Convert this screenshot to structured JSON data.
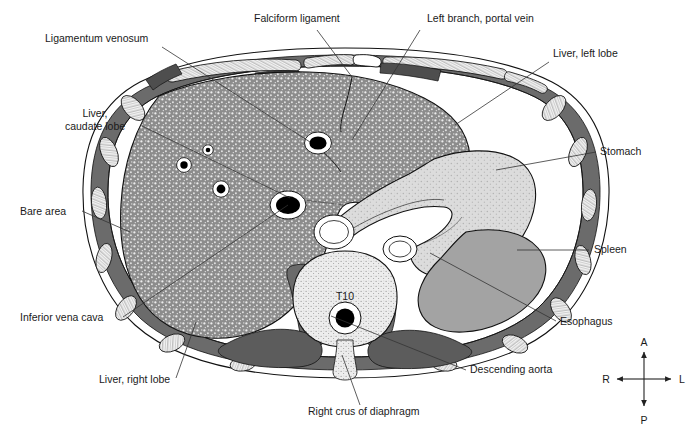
{
  "figure": {
    "vertebra_label": "T10",
    "colors": {
      "background": "#ffffff",
      "liver_parenchyma": "#8c8c8c",
      "liver_speckle": "#efefef",
      "body_wall_muscle": "#6b6b6b",
      "paraspinal_muscle": "#6b6b6b",
      "spleen": "#a3a3a3",
      "stomach": "#d2d2d2",
      "vertebra_bone": "#e6e6e6",
      "rib_bone": "#efefef",
      "vessel_lumen": "#000000",
      "vessel_wall": "#ffffff",
      "outline": "#111111",
      "leader_line": "#333333",
      "text": "#1a1a1a"
    }
  },
  "labels": [
    {
      "id": "ligamentum-venosum",
      "text": "Ligamentum venosum",
      "x": 45,
      "y": 42,
      "anchor": "start"
    },
    {
      "id": "falciform-ligament",
      "text": "Falciform ligament",
      "x": 254,
      "y": 22,
      "anchor": "start"
    },
    {
      "id": "left-branch-portal-vein",
      "text": "Left branch, portal vein",
      "x": 427,
      "y": 22,
      "anchor": "start"
    },
    {
      "id": "liver-left-lobe",
      "text": "Liver, left lobe",
      "x": 553,
      "y": 57,
      "anchor": "start"
    },
    {
      "id": "stomach",
      "text": "Stomach",
      "x": 600,
      "y": 155,
      "anchor": "start"
    },
    {
      "id": "spleen",
      "text": "Spleen",
      "x": 594,
      "y": 253,
      "anchor": "start"
    },
    {
      "id": "esophagus",
      "text": "Esophagus",
      "x": 560,
      "y": 325,
      "anchor": "start"
    },
    {
      "id": "descending-aorta",
      "text": "Descending aorta",
      "x": 470,
      "y": 373,
      "anchor": "start"
    },
    {
      "id": "right-crus-of-diaphragm",
      "text": "Right crus of diaphragm",
      "x": 308,
      "y": 415,
      "anchor": "start"
    },
    {
      "id": "liver-right-lobe",
      "text": "Liver, right lobe",
      "x": 99,
      "y": 383,
      "anchor": "start"
    },
    {
      "id": "inferior-vena-cava",
      "text": "Inferior vena cava",
      "x": 20,
      "y": 321,
      "anchor": "start"
    },
    {
      "id": "bare-area",
      "text": "Bare area",
      "x": 20,
      "y": 215,
      "anchor": "start"
    },
    {
      "id": "liver-caudate-lobe-line1",
      "text": "Liver,",
      "x": 95,
      "y": 117,
      "anchor": "middle"
    },
    {
      "id": "liver-caudate-lobe-line2",
      "text": "caudate lobe",
      "x": 95,
      "y": 130,
      "anchor": "middle"
    }
  ],
  "compass": {
    "anterior": "A",
    "posterior": "P",
    "right": "R",
    "left": "L",
    "center_x": 644,
    "center_y": 379
  },
  "leader_lines": [
    {
      "id": "ligamentum-venosum-leader",
      "points": "162,47 310,142"
    },
    {
      "id": "falciform-ligament-leader",
      "points": "317,30 352,77"
    },
    {
      "id": "left-branch-portal-vein-leader",
      "points": "420,30 352,140"
    },
    {
      "id": "liver-left-lobe-leader",
      "points": "549,62 455,125"
    },
    {
      "id": "stomach-leader",
      "points": "596,152 496,170"
    },
    {
      "id": "spleen-leader",
      "points": "589,250 517,250"
    },
    {
      "id": "esophagus-leader",
      "points": "556,321 430,253"
    },
    {
      "id": "descending-aorta-leader",
      "points": "466,370 331,316"
    },
    {
      "id": "right-crus-leader",
      "points": "360,405 342,355"
    },
    {
      "id": "liver-right-lobe-leader",
      "points": "176,378 196,322"
    },
    {
      "id": "inferior-vena-cava-leader",
      "points": "123,317 288,205"
    },
    {
      "id": "bare-area-leader",
      "points": "82,211 130,232"
    },
    {
      "id": "caudate-lobe-leader",
      "points": "142,126 290,198"
    }
  ],
  "structures": [
    {
      "id": "liver",
      "name": "Liver parenchyma"
    },
    {
      "id": "stomach-body",
      "name": "Stomach"
    },
    {
      "id": "spleen-body",
      "name": "Spleen"
    },
    {
      "id": "vertebra-t10",
      "name": "T10 vertebral body"
    },
    {
      "id": "spinal-canal",
      "name": "Spinal canal"
    },
    {
      "id": "descending-aorta-lumen",
      "name": "Descending aorta"
    },
    {
      "id": "inferior-vena-cava-lumen",
      "name": "Inferior vena cava"
    },
    {
      "id": "portal-vein-left-branch",
      "name": "Left branch of portal vein"
    },
    {
      "id": "hepatic-vessels",
      "name": "Hepatic vessels"
    },
    {
      "id": "body-wall",
      "name": "Body wall musculature"
    },
    {
      "id": "ribs",
      "name": "Ribs and costal cartilages"
    },
    {
      "id": "diaphragm-crura",
      "name": "Crura of diaphragm"
    },
    {
      "id": "paraspinal-muscles",
      "name": "Paraspinal musculature"
    }
  ]
}
